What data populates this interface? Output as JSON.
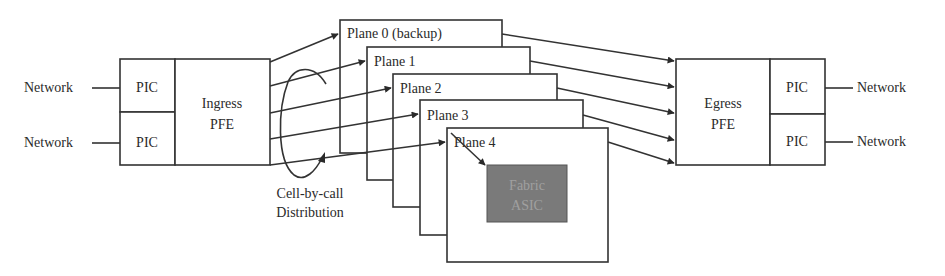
{
  "diagram": {
    "ingress": {
      "networks": [
        "Network",
        "Network"
      ],
      "pics": [
        "PIC",
        "PIC"
      ],
      "pfe_line1": "Ingress",
      "pfe_line2": "PFE"
    },
    "egress": {
      "networks": [
        "Network",
        "Network"
      ],
      "pics": [
        "PIC",
        "PIC"
      ],
      "pfe_line1": "Egress",
      "pfe_line2": "PFE"
    },
    "planes": [
      {
        "label": "Plane 0 (backup)"
      },
      {
        "label": "Plane 1"
      },
      {
        "label": "Plane 2"
      },
      {
        "label": "Plane 3"
      },
      {
        "label": "Plane 4"
      }
    ],
    "asic": {
      "line1": "Fabric",
      "line2": "ASIC",
      "fill": "#7a7a7a",
      "text_color": "#9a9a9a"
    },
    "distribution_label_line1": "Cell-by-call",
    "distribution_label_line2": "Distribution"
  }
}
